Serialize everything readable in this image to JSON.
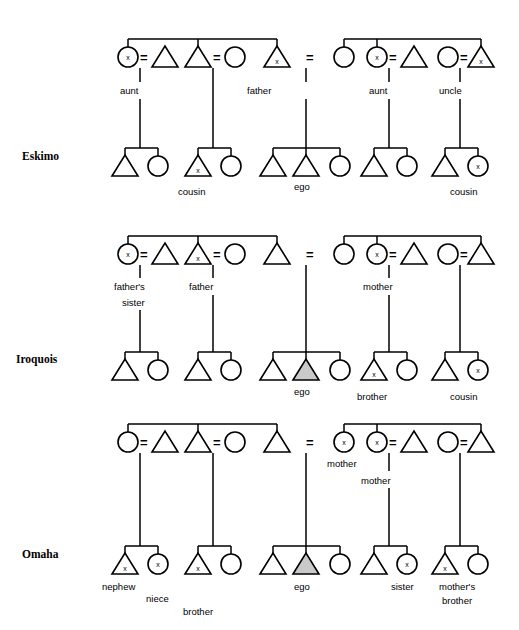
{
  "figure": {
    "colors": {
      "line": "#000000",
      "shape_fill": "#ffffff",
      "ego_fill": "#c9c9c9",
      "background": "#ffffff"
    },
    "symbol_legend": {
      "triangle": "male",
      "circle": "female",
      "equals": "marriage",
      "x_mark": "shared kin term marker",
      "shaded_triangle": "ego"
    }
  },
  "rows": [
    {
      "id": "eskimo",
      "label": "Eskimo",
      "generation1_labels": [
        {
          "id": "eskimo-aunt-left",
          "text": "aunt"
        },
        {
          "id": "eskimo-father",
          "text": "father"
        },
        {
          "id": "eskimo-aunt-right",
          "text": "aunt"
        },
        {
          "id": "eskimo-uncle",
          "text": "uncle"
        }
      ],
      "generation2_labels": [
        {
          "id": "eskimo-cousin-left",
          "text": "cousin"
        },
        {
          "id": "eskimo-ego",
          "text": "ego"
        },
        {
          "id": "eskimo-cousin-right",
          "text": "cousin"
        }
      ]
    },
    {
      "id": "iroquois",
      "label": "Iroquois",
      "generation1_labels": [
        {
          "id": "iroquois-fathers-sister-line1",
          "text": "father's"
        },
        {
          "id": "iroquois-fathers-sister-line2",
          "text": "sister"
        },
        {
          "id": "iroquois-father",
          "text": "father"
        },
        {
          "id": "iroquois-mother",
          "text": "mother"
        }
      ],
      "generation2_labels": [
        {
          "id": "iroquois-ego",
          "text": "ego"
        },
        {
          "id": "iroquois-brother",
          "text": "brother"
        },
        {
          "id": "iroquois-cousin",
          "text": "cousin"
        }
      ]
    },
    {
      "id": "omaha",
      "label": "Omaha",
      "generation1_labels": [
        {
          "id": "omaha-mother-upper",
          "text": "mother"
        },
        {
          "id": "omaha-mother-lower",
          "text": "mother"
        }
      ],
      "generation2_labels": [
        {
          "id": "omaha-nephew",
          "text": "nephew"
        },
        {
          "id": "omaha-niece",
          "text": "niece"
        },
        {
          "id": "omaha-brother",
          "text": "brother"
        },
        {
          "id": "omaha-ego",
          "text": "ego"
        },
        {
          "id": "omaha-sister",
          "text": "sister"
        },
        {
          "id": "omaha-mothers-brother-line1",
          "text": "mother's"
        },
        {
          "id": "omaha-mothers-brother-line2",
          "text": "brother"
        }
      ]
    }
  ],
  "marriage_symbol": "=",
  "x_symbol": "x"
}
